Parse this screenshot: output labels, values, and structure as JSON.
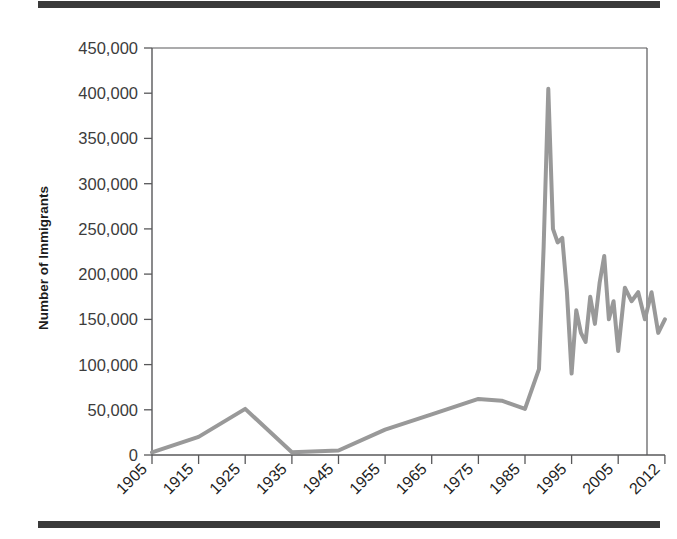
{
  "figure": {
    "background_color": "#ffffff",
    "rule_color": "#3a3a3a",
    "axis_color": "#58585a",
    "line_color": "#999999"
  },
  "chart_data": {
    "type": "line",
    "title": "",
    "subtitle": "",
    "xlabel": "",
    "ylabel": "Number of Immigrants",
    "xlim": [
      1905,
      2012
    ],
    "ylim": [
      0,
      450000
    ],
    "grid": false,
    "legend": null,
    "y_ticks": [
      0,
      50000,
      100000,
      150000,
      200000,
      250000,
      300000,
      350000,
      400000,
      450000
    ],
    "y_tick_labels": [
      "0",
      "50,000",
      "100,000",
      "150,000",
      "200,000",
      "250,000",
      "300,000",
      "350,000",
      "400,000",
      "450,000"
    ],
    "x_ticks": [
      1905,
      1915,
      1925,
      1935,
      1945,
      1955,
      1965,
      1975,
      1985,
      1995,
      2005,
      2012
    ],
    "x_tick_labels": [
      "1905",
      "1915",
      "1925",
      "1935",
      "1945",
      "1955",
      "1965",
      "1975",
      "1985",
      "1995",
      "2005",
      "2012"
    ],
    "x_tick_label_rotation": 45,
    "series": [
      {
        "name": "Number of Immigrants",
        "color": "#999999",
        "line_width": 4,
        "x": [
          1905,
          1915,
          1925,
          1935,
          1945,
          1955,
          1965,
          1975,
          1980,
          1985,
          1988,
          1989,
          1990,
          1991,
          1992,
          1993,
          1994,
          1995,
          1996,
          1997,
          1998,
          1999,
          2000,
          2001,
          2002,
          2003,
          2004,
          2005,
          2006,
          2007,
          2008,
          2009,
          2010,
          2011,
          2012
        ],
        "y": [
          3000,
          20000,
          51000,
          3000,
          5000,
          28000,
          45000,
          62000,
          60000,
          51000,
          95000,
          230000,
          405000,
          250000,
          235000,
          240000,
          180000,
          90000,
          160000,
          135000,
          125000,
          175000,
          145000,
          190000,
          220000,
          150000,
          170000,
          115000,
          185000,
          170000,
          180000,
          150000,
          180000,
          135000,
          150000
        ],
        "annotations": [
          {
            "label": "peak",
            "x": 1990,
            "y": 405000
          }
        ]
      }
    ]
  }
}
